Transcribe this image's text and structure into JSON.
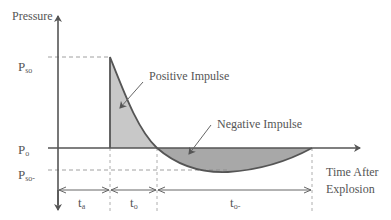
{
  "diagram": {
    "type": "blast-pressure-time-history",
    "y_axis_label": "Pressure",
    "x_axis_label_line1": "Time After",
    "x_axis_label_line2": "Explosion",
    "levels": {
      "peak": {
        "main": "P",
        "sub": "so"
      },
      "ambient": {
        "main": "P",
        "sub": "o"
      },
      "negative_peak": {
        "main": "P",
        "sub": "so-"
      }
    },
    "annotations": {
      "positive": "Positive Impulse",
      "negative": "Negative Impulse"
    },
    "durations": {
      "arrival": {
        "main": "t",
        "sub": "a"
      },
      "positive_phase": {
        "main": "t",
        "sub": "o"
      },
      "negative_phase": {
        "main": "t",
        "sub": "o-"
      }
    },
    "colors": {
      "line": "#555555",
      "positive_fill": "#c8c8c8",
      "negative_fill": "#a8a8a8",
      "text": "#555555"
    }
  }
}
